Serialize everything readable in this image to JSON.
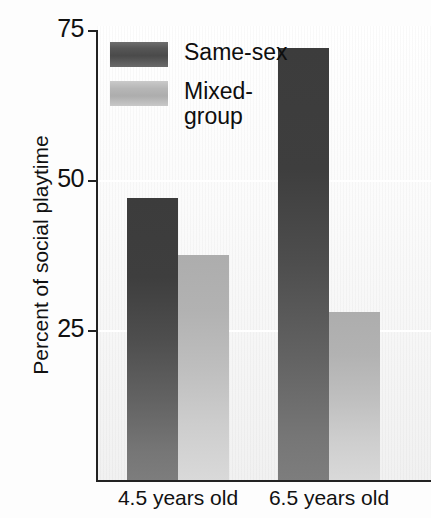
{
  "chart_data": {
    "type": "bar",
    "title": "",
    "xlabel": "",
    "ylabel": "Percent of social playtime",
    "categories": [
      "4.5 years old",
      "6.5 years old"
    ],
    "series": [
      {
        "name": "Same-sex",
        "values": [
          47,
          72
        ]
      },
      {
        "name": "Mixed-group",
        "values": [
          37.5,
          28
        ]
      }
    ],
    "ylim": [
      0,
      75
    ],
    "yticks": [
      25,
      50,
      75
    ],
    "ytick_labels": [
      "25",
      "50",
      "75"
    ],
    "grid": true,
    "legend_position": "top-left",
    "colors": {
      "same_sex_dark": "#3c3c3c",
      "same_sex_light": "#7d7d7d",
      "mixed_group_dark": "#adadad",
      "mixed_group_light": "#d9d9d9",
      "axis": "#222222",
      "background": "#fdfdfd"
    }
  },
  "axis": {
    "y_title": "Percent of social playtime",
    "ticks": [
      {
        "label": "75",
        "value": 75
      },
      {
        "label": "50",
        "value": 50
      },
      {
        "label": "25",
        "value": 25
      }
    ]
  },
  "legend": {
    "items": [
      {
        "label": "Same-sex",
        "swatch": "dark"
      },
      {
        "label": "Mixed-\ngroup",
        "swatch": "light"
      }
    ]
  },
  "x_labels": [
    {
      "label": "4.5 years old"
    },
    {
      "label": "6.5 years old"
    }
  ]
}
